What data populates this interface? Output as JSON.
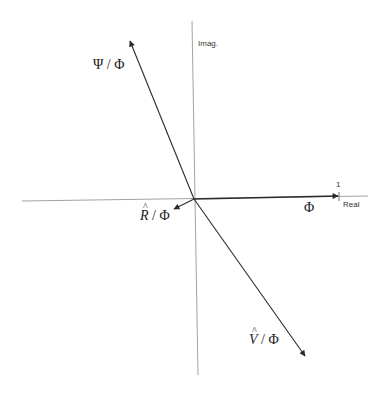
{
  "diagram": {
    "type": "phasor-diagram",
    "axes": {
      "real_label": "Real",
      "imag_label": "Imag.",
      "tick_label": "1",
      "axis_color": "#8a8a8a"
    },
    "vectors": [
      {
        "id": "phi",
        "label": "Φ",
        "from": [
          194,
          199
        ],
        "to": [
          338,
          196
        ]
      },
      {
        "id": "psi",
        "label_main": "Ψ",
        "label_sep": " / ",
        "label_den": "Φ",
        "from": [
          194,
          199
        ],
        "to": [
          130,
          41
        ]
      },
      {
        "id": "r",
        "label_main": "R",
        "label_sep": " / ",
        "label_den": "Φ",
        "from": [
          194,
          199
        ],
        "to": [
          174,
          209
        ]
      },
      {
        "id": "v",
        "label_main": "V",
        "label_sep": " / ",
        "label_den": "Φ",
        "from": [
          194,
          199
        ],
        "to": [
          305,
          356
        ]
      }
    ],
    "vector_color": "#2a2a2a"
  }
}
